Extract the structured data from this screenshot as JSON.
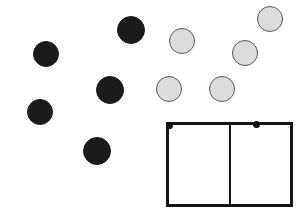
{
  "canvas": {
    "width": 304,
    "height": 214,
    "background": "#ffffff"
  },
  "palette": {
    "dark_disc_fill": "#1b1b1b",
    "light_disc_fill": "#dcdcdc",
    "light_disc_stroke": "#5a5a5a",
    "frame_stroke": "#141414",
    "marker_fill": "#0d0d0d"
  },
  "scene": {
    "dark_discs": [
      {
        "id": "dark-1",
        "cx": 46,
        "cy": 54,
        "r": 13
      },
      {
        "id": "dark-2",
        "cx": 131,
        "cy": 30,
        "r": 14
      },
      {
        "id": "dark-3",
        "cx": 110,
        "cy": 90,
        "r": 14
      },
      {
        "id": "dark-4",
        "cx": 40,
        "cy": 112,
        "r": 13
      },
      {
        "id": "dark-5",
        "cx": 97,
        "cy": 151,
        "r": 14
      }
    ],
    "light_discs": [
      {
        "id": "light-1",
        "cx": 270,
        "cy": 19,
        "r": 13
      },
      {
        "id": "light-2",
        "cx": 182,
        "cy": 41,
        "r": 13
      },
      {
        "id": "light-3",
        "cx": 245,
        "cy": 53,
        "r": 13
      },
      {
        "id": "light-4",
        "cx": 169,
        "cy": 89,
        "r": 13
      },
      {
        "id": "light-5",
        "cx": 222,
        "cy": 89,
        "r": 13
      }
    ],
    "frame": {
      "x": 166,
      "y": 122,
      "width": 127,
      "height": 85,
      "border_width": 3
    },
    "divider": {
      "x": 229,
      "y": 122,
      "width": 2,
      "height": 85
    },
    "markers": [
      {
        "id": "marker-left",
        "cx": 169,
        "cy": 125,
        "r": 3.5
      },
      {
        "id": "marker-right",
        "cx": 256,
        "cy": 124,
        "r": 3.5
      }
    ]
  }
}
